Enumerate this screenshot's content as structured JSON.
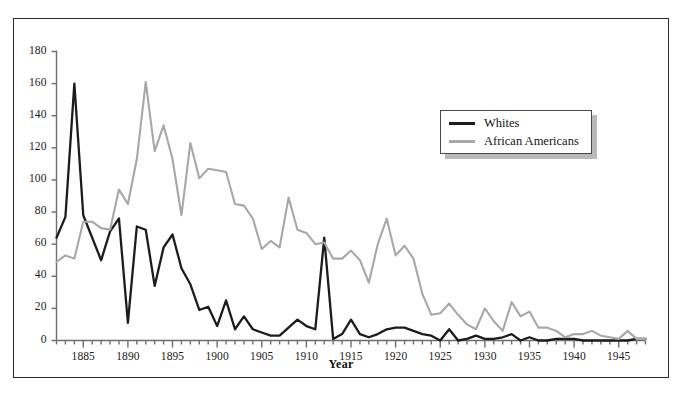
{
  "figure": {
    "frame_color": "#2b2b2b",
    "background": "#ffffff"
  },
  "axis": {
    "x_title": "Year",
    "y_tick_labels": [
      "0",
      "20",
      "40",
      "60",
      "80",
      "100",
      "120",
      "140",
      "160",
      "180"
    ],
    "x_tick_labels": [
      "1885",
      "1890",
      "1895",
      "1900",
      "1905",
      "1910",
      "1915",
      "1920",
      "1925",
      "1930",
      "1935",
      "1940",
      "1945"
    ]
  },
  "legend": {
    "items": [
      {
        "label": "Whites",
        "color": "#1c1c1c"
      },
      {
        "label": "African Americans",
        "color": "#a8a8a8"
      }
    ]
  },
  "chart_data": {
    "type": "line",
    "title": "",
    "subtitle": "",
    "xlabel": "Year",
    "ylabel": "",
    "xlim": [
      1882,
      1948
    ],
    "ylim": [
      0,
      180
    ],
    "ytick_step": 20,
    "xtick_step_major": 5,
    "xtick_step_minor": 1,
    "grid": false,
    "legend_position": "upper-right-inside",
    "x": [
      1882,
      1883,
      1884,
      1885,
      1886,
      1887,
      1888,
      1889,
      1890,
      1891,
      1892,
      1893,
      1894,
      1895,
      1896,
      1897,
      1898,
      1899,
      1900,
      1901,
      1902,
      1903,
      1904,
      1905,
      1906,
      1907,
      1908,
      1909,
      1910,
      1911,
      1912,
      1913,
      1914,
      1915,
      1916,
      1917,
      1918,
      1919,
      1920,
      1921,
      1922,
      1923,
      1924,
      1925,
      1926,
      1927,
      1928,
      1929,
      1930,
      1931,
      1932,
      1933,
      1934,
      1935,
      1936,
      1937,
      1938,
      1939,
      1940,
      1941,
      1942,
      1943,
      1944,
      1945,
      1946,
      1947,
      1948
    ],
    "series": [
      {
        "name": "Whites",
        "color": "#1c1c1c",
        "values": [
          64,
          77,
          160,
          78,
          64,
          50,
          68,
          76,
          11,
          71,
          69,
          34,
          58,
          66,
          45,
          35,
          19,
          21,
          9,
          25,
          7,
          15,
          7,
          5,
          3,
          3,
          8,
          13,
          9,
          7,
          64,
          1,
          4,
          13,
          4,
          2,
          4,
          7,
          8,
          8,
          6,
          4,
          3,
          0,
          7,
          0,
          1,
          3,
          1,
          1,
          2,
          4,
          0,
          2,
          0,
          0,
          1,
          1,
          1,
          0,
          0,
          0,
          0,
          0,
          0,
          1,
          1
        ]
      },
      {
        "name": "African Americans",
        "color": "#a8a8a8",
        "values": [
          49,
          53,
          51,
          74,
          74,
          70,
          69,
          94,
          85,
          113,
          161,
          118,
          134,
          113,
          78,
          123,
          101,
          107,
          106,
          105,
          85,
          84,
          76,
          57,
          62,
          58,
          89,
          69,
          67,
          60,
          61,
          51,
          51,
          56,
          50,
          36,
          60,
          76,
          53,
          59,
          51,
          29,
          16,
          17,
          23,
          16,
          10,
          7,
          20,
          12,
          6,
          24,
          15,
          18,
          8,
          8,
          6,
          2,
          4,
          4,
          6,
          3,
          2,
          1,
          6,
          1,
          1
        ]
      }
    ]
  }
}
